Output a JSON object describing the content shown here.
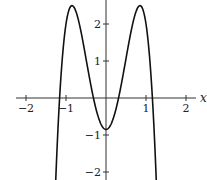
{
  "chart_data": {
    "type": "line",
    "title": "",
    "xlabel": "x",
    "ylabel": "",
    "xlim": [
      -2.2,
      2.3
    ],
    "ylim": [
      -2.2,
      2.65
    ],
    "x_ticks": [
      -2,
      -1,
      1,
      2
    ],
    "x_tick_labels": [
      "−2",
      "−1",
      "1",
      "2"
    ],
    "y_ticks": [
      -2,
      -1,
      1,
      2
    ],
    "y_tick_labels": [
      "−2",
      "−1",
      "1",
      "2"
    ],
    "grid": false,
    "series": [
      {
        "name": "f(x)",
        "description": "even quartic with two local maxima ≈2.5 at x≈±0.85 and local minimum ≈−0.85 at x=0",
        "x": [
          -1.3,
          -1.2,
          -1.15,
          -1.1,
          -1.0,
          -0.85,
          -0.7,
          -0.5,
          -0.35,
          -0.2,
          0,
          0.2,
          0.35,
          0.5,
          0.7,
          0.85,
          1.0,
          1.1,
          1.15,
          1.2,
          1.3
        ],
        "y": [
          -2.5,
          -0.85,
          0.0,
          0.9,
          2.0,
          2.5,
          2.1,
          1.1,
          0.0,
          -0.49,
          -0.85,
          -0.49,
          0.0,
          1.1,
          2.1,
          2.5,
          2.0,
          0.9,
          0.0,
          -0.85,
          -2.5
        ]
      }
    ]
  }
}
